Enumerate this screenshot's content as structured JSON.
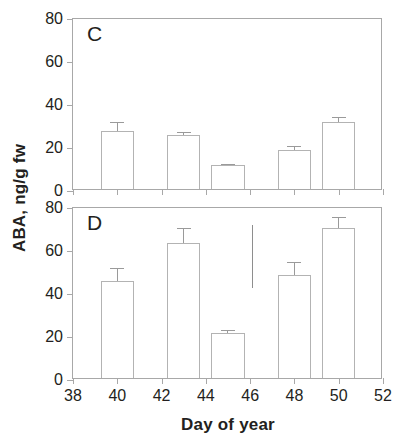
{
  "chart_data": [
    {
      "type": "bar",
      "title": "C",
      "panel_label": "C",
      "xlabel": "Day of year",
      "ylabel": "ABA, ng/g fw",
      "xlim": [
        38,
        52
      ],
      "ylim": [
        0,
        80
      ],
      "xticks": [
        38,
        40,
        42,
        44,
        46,
        48,
        50,
        52
      ],
      "yticks": [
        0,
        20,
        40,
        60,
        80
      ],
      "grid": false,
      "legend": "none",
      "x": [
        40,
        43,
        45,
        48,
        50
      ],
      "categories": [
        "40",
        "43",
        "45",
        "48",
        "50"
      ],
      "values": [
        27,
        25,
        11,
        18,
        31
      ],
      "errors": [
        4,
        1.5,
        0.8,
        2,
        2.5
      ],
      "bar_width_days": 1.5
    },
    {
      "type": "bar",
      "title": "D",
      "panel_label": "D",
      "xlabel": "Day of year",
      "ylabel": "ABA, ng/g fw",
      "xlim": [
        38,
        52
      ],
      "ylim": [
        0,
        80
      ],
      "xticks": [
        38,
        40,
        42,
        44,
        46,
        48,
        50,
        52
      ],
      "yticks": [
        0,
        20,
        40,
        60,
        80
      ],
      "grid": false,
      "legend": "none",
      "x": [
        40,
        43,
        45,
        48,
        50
      ],
      "categories": [
        "40",
        "43",
        "45",
        "48",
        "50"
      ],
      "values": [
        45,
        63,
        21,
        48,
        70
      ],
      "errors": [
        6,
        7,
        1.5,
        6,
        5
      ],
      "bar_width_days": 1.5,
      "annotations": [
        {
          "type": "vertical-line",
          "x": 46.1,
          "y_start": 42,
          "y_end": 71
        }
      ]
    }
  ],
  "axes": {
    "y_title": "ABA, ng/g fw",
    "x_title": "Day of year",
    "y_tick_labels": [
      "0",
      "20",
      "40",
      "60",
      "80"
    ],
    "x_tick_labels": [
      "38",
      "40",
      "42",
      "44",
      "46",
      "48",
      "50",
      "52"
    ]
  },
  "panels": {
    "top": {
      "letter": "C"
    },
    "bottom": {
      "letter": "D"
    }
  },
  "colors": {
    "axis": "#a8a8a8",
    "bar_outline": "#b3b3b3",
    "bar_fill": "#ffffff",
    "error_bar": "#9a9a9a",
    "text": "#231f20",
    "background": "#ffffff"
  }
}
